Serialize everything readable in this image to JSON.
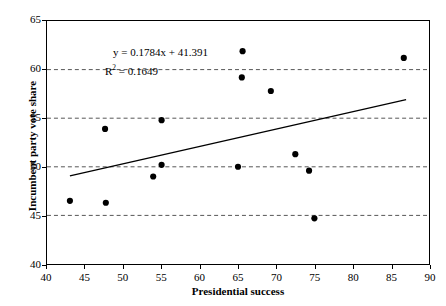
{
  "chart_data": {
    "type": "scatter",
    "title": "",
    "xlabel": "Presidential success",
    "ylabel": "Incumbent party vote share",
    "xlim": [
      40,
      90
    ],
    "ylim": [
      40,
      65
    ],
    "xticks": [
      40,
      45,
      50,
      55,
      60,
      65,
      70,
      75,
      80,
      85,
      90
    ],
    "yticks": [
      40,
      45,
      50,
      55,
      60,
      65
    ],
    "grid": "horizontal-dashed",
    "legend": "none",
    "marker": {
      "shape": "circle",
      "color": "#000000",
      "size": 5
    },
    "points": [
      {
        "x": 43.0,
        "y": 46.5
      },
      {
        "x": 47.7,
        "y": 46.3
      },
      {
        "x": 47.6,
        "y": 53.9
      },
      {
        "x": 53.9,
        "y": 49.0
      },
      {
        "x": 55.0,
        "y": 50.2
      },
      {
        "x": 55.0,
        "y": 54.8
      },
      {
        "x": 65.0,
        "y": 50.0
      },
      {
        "x": 65.5,
        "y": 59.2
      },
      {
        "x": 65.6,
        "y": 61.9
      },
      {
        "x": 69.3,
        "y": 57.8
      },
      {
        "x": 72.5,
        "y": 51.3
      },
      {
        "x": 74.3,
        "y": 49.6
      },
      {
        "x": 75.0,
        "y": 44.7
      },
      {
        "x": 86.7,
        "y": 61.2
      }
    ],
    "trendline": {
      "type": "linear",
      "slope": 0.1784,
      "intercept": 41.391,
      "r_squared": 0.1649,
      "x_start": 43.0,
      "x_end": 87.0,
      "color": "#000000"
    },
    "annotations": {
      "equation": "y = 0.1784x + 41.391",
      "r2_prefix": "R",
      "r2_exponent": "2",
      "r2_value": " = 0.1649"
    }
  },
  "axes": {
    "x_title": "Presidential success",
    "y_title": "Incumbent party vote share",
    "x_tick_labels": [
      "40",
      "45",
      "50",
      "55",
      "60",
      "65",
      "70",
      "75",
      "80",
      "85",
      "90"
    ],
    "y_tick_labels": [
      "40",
      "45",
      "50",
      "55",
      "60",
      "65"
    ]
  },
  "colors": {
    "axis": "#000000",
    "grid": "#555555",
    "marker": "#000000",
    "trend": "#000000",
    "background": "#ffffff"
  }
}
